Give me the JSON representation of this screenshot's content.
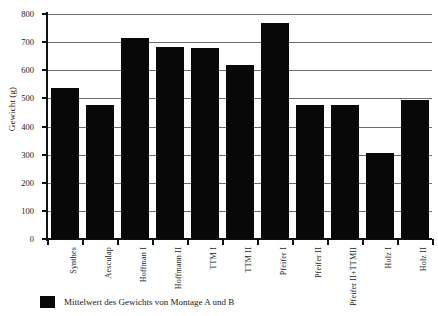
{
  "chart_data": {
    "type": "bar",
    "title": "",
    "xlabel": "",
    "ylabel": "Gewicht (g)",
    "ylim": [
      0,
      800
    ],
    "ytick_step": 100,
    "yticks": [
      "800",
      "700",
      "600",
      "500",
      "400",
      "300",
      "200",
      "100",
      "0"
    ],
    "grid": true,
    "legend_position": "bottom-left",
    "bar_color": "#080808",
    "grid_color": "#6d6d6d",
    "axis_color": "#111111",
    "categories": [
      "Synthes",
      "Aesculap",
      "Hoffman I",
      "Hoffmann II",
      "TTM I",
      "TTM II",
      "Pfeifer I",
      "Pfeifer II",
      "Pfeifer II+TTMII",
      "Holz I",
      "Holz II"
    ],
    "values": [
      537,
      478,
      714,
      682,
      678,
      619,
      769,
      478,
      478,
      305,
      495
    ],
    "series": [
      {
        "name": "Mittelwert des Gewichts von Montage A und B",
        "values": [
          537,
          478,
          714,
          682,
          678,
          619,
          769,
          478,
          478,
          305,
          495
        ]
      }
    ],
    "legend": [
      "Mittelwert des Gewichts von Montage A und B"
    ]
  }
}
